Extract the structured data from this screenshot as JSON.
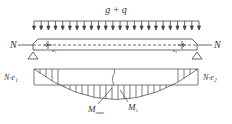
{
  "load": {
    "label": "g + q",
    "arrow_count": 24,
    "x_start": 34,
    "x_end": 199
  },
  "beam": {
    "axial_force_left": "N",
    "axial_force_right": "N",
    "eccentricity_left": "e₁",
    "eccentricity_right": "e₂"
  },
  "moment_diagram": {
    "left_end_label": "N·e₁",
    "right_end_label": "N·e₂",
    "max_label_main": "M",
    "max_label_sub": "max",
    "m1_label_main": "M",
    "m1_label_sub": "1"
  },
  "colors": {
    "line": "#444444",
    "text": "#333333"
  }
}
